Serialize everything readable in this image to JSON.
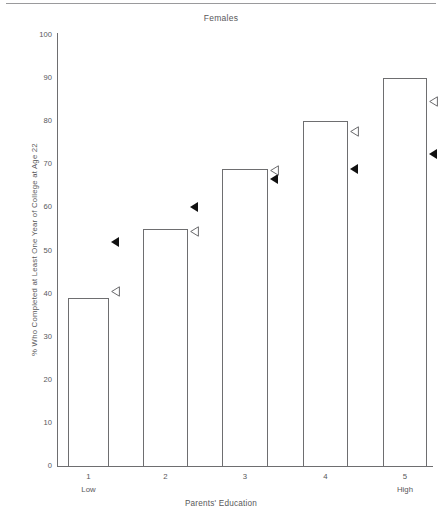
{
  "chart_data": {
    "type": "bar",
    "title": "Females",
    "xlabel": "Parents' Education",
    "ylabel": "% Who Completed at Least One Year of College at Age 22",
    "categories": [
      "1",
      "2",
      "3",
      "4",
      "5"
    ],
    "category_sublabels": [
      "Low",
      "",
      "",
      "",
      "High"
    ],
    "values": [
      39,
      55,
      69,
      80,
      90
    ],
    "ylim": [
      0,
      100
    ],
    "yticks": [
      0,
      10,
      20,
      30,
      40,
      50,
      60,
      70,
      80,
      90,
      100
    ],
    "ytick_labels": [
      "0",
      "10",
      "20",
      "30",
      "40",
      "50",
      "60",
      "70",
      "80",
      "90",
      "100"
    ],
    "grid": false,
    "legend": "none",
    "series": [
      {
        "name": "bars",
        "marker": "bar-outline",
        "values": [
          39,
          55,
          69,
          80,
          90
        ]
      },
      {
        "name": "filled-triangle",
        "marker": "left-triangle-filled",
        "color": "#111111",
        "values": [
          52,
          60,
          66.5,
          69,
          72.5
        ]
      },
      {
        "name": "open-triangle",
        "marker": "left-triangle-open",
        "color": "#ffffff",
        "values": [
          40.5,
          54.5,
          68.5,
          77.5,
          84.5
        ]
      }
    ],
    "bar_color": "#ffffff",
    "bar_edge_color": "#6e6e70",
    "axis_color": "#6e6e70",
    "text_color": "#58585a"
  }
}
